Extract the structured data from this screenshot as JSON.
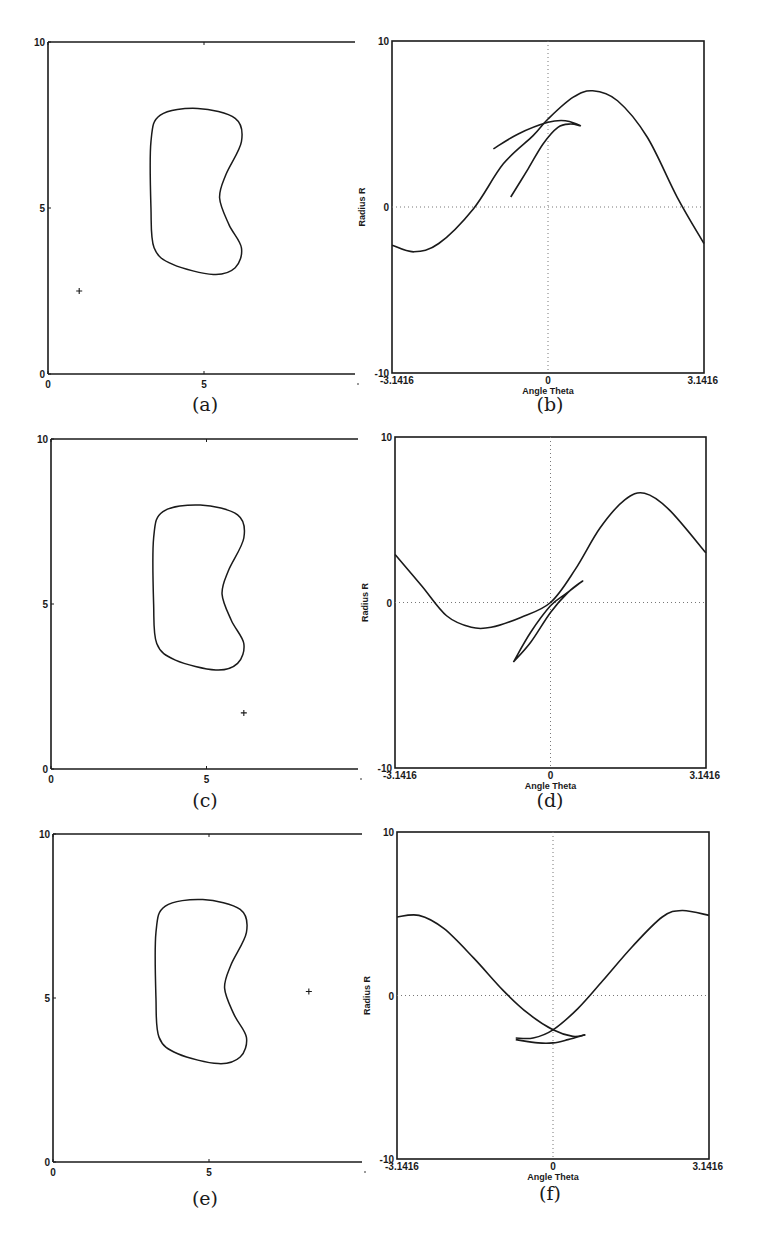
{
  "figure": {
    "panels": [
      {
        "id": "a",
        "caption": "(a)",
        "type": "workspace",
        "xticks": [
          "0",
          "5"
        ],
        "yticks": [
          "0",
          "5",
          "10"
        ],
        "obstacle": "kidney",
        "point": {
          "x": 1.0,
          "y": 2.5,
          "marker": "+"
        }
      },
      {
        "id": "b",
        "caption": "(b)",
        "type": "configuration-space",
        "xlabel": "Angle Theta",
        "ylabel": "Radius R",
        "xticks": [
          "-3.1416",
          "0",
          "3.1416"
        ],
        "yticks": [
          "-10",
          "0",
          "10"
        ]
      },
      {
        "id": "c",
        "caption": "(c)",
        "type": "workspace",
        "xticks": [
          "0",
          "5"
        ],
        "yticks": [
          "0",
          "5",
          "10"
        ],
        "obstacle": "kidney",
        "point": {
          "x": 6.2,
          "y": 1.7,
          "marker": "+"
        }
      },
      {
        "id": "d",
        "caption": "(d)",
        "type": "configuration-space",
        "xlabel": "Angle Theta",
        "ylabel": "Radius R",
        "xticks": [
          "-3.1416",
          "0",
          "3.1416"
        ],
        "yticks": [
          "-10",
          "0",
          "10"
        ]
      },
      {
        "id": "e",
        "caption": "(e)",
        "type": "workspace",
        "xticks": [
          "0",
          "5"
        ],
        "yticks": [
          "0",
          "5",
          "10"
        ],
        "obstacle": "kidney",
        "point": {
          "x": 8.2,
          "y": 5.2,
          "marker": "+"
        }
      },
      {
        "id": "f",
        "caption": "(f)",
        "type": "configuration-space",
        "xlabel": "Angle Theta",
        "ylabel": "Radius R",
        "xticks": [
          "-3.1416",
          "0",
          "3.1416"
        ],
        "yticks": [
          "-10",
          "0",
          "10"
        ]
      }
    ]
  },
  "chart_data": [
    {
      "type": "line",
      "panel": "a",
      "title": "",
      "xlabel": "",
      "ylabel": "",
      "xlim": [
        0,
        10
      ],
      "ylim": [
        0,
        10
      ],
      "grid": false,
      "series": [
        {
          "name": "obstacle boundary (closed kidney shape)",
          "x": [
            4.8,
            6.0,
            6.2,
            5.7,
            5.5,
            5.8,
            6.2,
            6.0,
            5.3,
            4.0,
            3.4,
            3.3,
            3.3,
            3.6,
            4.8
          ],
          "y": [
            8.0,
            7.7,
            7.0,
            6.0,
            5.3,
            4.5,
            3.8,
            3.2,
            3.0,
            3.3,
            3.8,
            5.0,
            7.0,
            7.8,
            8.0
          ]
        },
        {
          "name": "point",
          "x": [
            1.0
          ],
          "y": [
            2.5
          ]
        }
      ]
    },
    {
      "type": "line",
      "panel": "b",
      "title": "",
      "xlabel": "Angle Theta",
      "ylabel": "Radius R",
      "xlim": [
        -3.1416,
        3.1416
      ],
      "ylim": [
        -10,
        10
      ],
      "grid": "dotted at 0",
      "series": [
        {
          "name": "main curve",
          "x": [
            -3.14,
            -2.7,
            -2.2,
            -1.5,
            -0.9,
            -0.3,
            0,
            0.5,
            0.9,
            1.4,
            2.0,
            2.6,
            3.14
          ],
          "y": [
            -2.3,
            -2.7,
            -2.2,
            -0.1,
            2.6,
            4.3,
            5.3,
            6.6,
            7.0,
            6.4,
            4.2,
            0.6,
            -2.2
          ]
        },
        {
          "name": "inner loop",
          "x": [
            -0.75,
            -0.4,
            -0.1,
            0.2,
            0.45,
            0.65,
            0.35,
            0,
            -0.6,
            -1.1
          ],
          "y": [
            0.6,
            2.3,
            3.8,
            4.8,
            5.0,
            4.9,
            5.2,
            5.1,
            4.4,
            3.5
          ]
        }
      ]
    },
    {
      "type": "line",
      "panel": "c",
      "title": "",
      "xlabel": "",
      "ylabel": "",
      "xlim": [
        0,
        10
      ],
      "ylim": [
        0,
        10
      ],
      "grid": false,
      "series": [
        {
          "name": "obstacle boundary (closed kidney shape)",
          "x": [
            4.8,
            6.0,
            6.2,
            5.7,
            5.5,
            5.8,
            6.2,
            6.0,
            5.3,
            4.0,
            3.4,
            3.3,
            3.3,
            3.6,
            4.8
          ],
          "y": [
            8.0,
            7.7,
            7.0,
            6.0,
            5.3,
            4.5,
            3.8,
            3.2,
            3.0,
            3.3,
            3.8,
            5.0,
            7.0,
            7.8,
            8.0
          ]
        },
        {
          "name": "point",
          "x": [
            6.2
          ],
          "y": [
            1.7
          ]
        }
      ]
    },
    {
      "type": "line",
      "panel": "d",
      "title": "",
      "xlabel": "Angle Theta",
      "ylabel": "Radius R",
      "xlim": [
        -3.1416,
        3.1416
      ],
      "ylim": [
        -10,
        10
      ],
      "grid": "dotted at 0",
      "series": [
        {
          "name": "main curve",
          "x": [
            -3.14,
            -2.6,
            -2.1,
            -1.6,
            -1.2,
            -0.6,
            0,
            0.5,
            1.0,
            1.5,
            1.9,
            2.4,
            3.14
          ],
          "y": [
            2.9,
            1.0,
            -0.8,
            -1.5,
            -1.5,
            -0.9,
            0,
            2.0,
            4.5,
            6.2,
            6.6,
            5.6,
            3.0
          ]
        },
        {
          "name": "inner loop",
          "x": [
            -0.75,
            -0.4,
            0,
            0.35,
            0.65,
            0.3,
            0,
            -0.4,
            -0.75
          ],
          "y": [
            -3.6,
            -2.4,
            -0.6,
            0.6,
            1.3,
            0.5,
            -0.2,
            -1.8,
            -3.6
          ]
        }
      ]
    },
    {
      "type": "line",
      "panel": "e",
      "title": "",
      "xlabel": "",
      "ylabel": "",
      "xlim": [
        0,
        10
      ],
      "ylim": [
        0,
        10
      ],
      "grid": false,
      "series": [
        {
          "name": "obstacle boundary (closed kidney shape)",
          "x": [
            4.8,
            6.0,
            6.2,
            5.7,
            5.5,
            5.8,
            6.2,
            6.0,
            5.3,
            4.0,
            3.4,
            3.3,
            3.3,
            3.6,
            4.8
          ],
          "y": [
            8.0,
            7.7,
            7.0,
            6.0,
            5.3,
            4.5,
            3.8,
            3.2,
            3.0,
            3.3,
            3.8,
            5.0,
            7.0,
            7.8,
            8.0
          ]
        },
        {
          "name": "point",
          "x": [
            8.2
          ],
          "y": [
            5.2
          ]
        }
      ]
    },
    {
      "type": "line",
      "panel": "f",
      "title": "",
      "xlabel": "Angle Theta",
      "ylabel": "Radius R",
      "xlim": [
        -3.1416,
        3.1416
      ],
      "ylim": [
        -10,
        10
      ],
      "grid": "dotted at 0",
      "series": [
        {
          "name": "descending branch",
          "x": [
            -3.14,
            -2.7,
            -2.2,
            -1.6,
            -1.0,
            -0.5,
            0,
            0.4,
            0.65
          ],
          "y": [
            4.8,
            4.9,
            4.1,
            2.3,
            0.3,
            -1.1,
            -2.1,
            -2.5,
            -2.4
          ]
        },
        {
          "name": "ascending branch",
          "x": [
            -0.75,
            -0.4,
            0,
            0.5,
            1.0,
            1.6,
            2.2,
            2.6,
            3.14
          ],
          "y": [
            -2.6,
            -2.6,
            -2.1,
            -0.8,
            0.9,
            3.0,
            4.8,
            5.2,
            4.9
          ]
        },
        {
          "name": "lower arc",
          "x": [
            -0.75,
            -0.3,
            0,
            0.3,
            0.65
          ],
          "y": [
            -2.7,
            -2.9,
            -2.9,
            -2.7,
            -2.4
          ]
        }
      ]
    }
  ]
}
